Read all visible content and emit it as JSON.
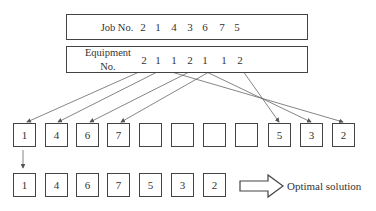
{
  "header": {
    "job_label": "Job No.",
    "equipment_label_line1": "Equipment",
    "equipment_label_line2": "No.",
    "job_numbers": [
      "2",
      "1",
      "4",
      "3",
      "6",
      "7",
      "5"
    ],
    "equipment_numbers": [
      "2",
      "1",
      "1",
      "2",
      "1",
      "1",
      "2"
    ]
  },
  "schedule_row": {
    "cells": [
      "1",
      "4",
      "6",
      "7",
      "",
      "",
      "",
      "",
      "5",
      "3",
      "2"
    ]
  },
  "result_row": {
    "cells": [
      "1",
      "4",
      "6",
      "7",
      "5",
      "3",
      "2"
    ],
    "result_label": "Optimal solution"
  }
}
